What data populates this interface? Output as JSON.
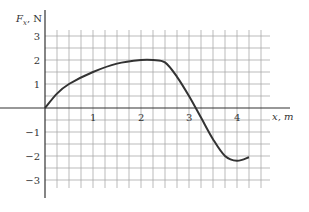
{
  "chart_data": {
    "type": "line",
    "title": "",
    "xlabel": "x, m",
    "ylabel": "F_x, N",
    "xlim": [
      0,
      4.5
    ],
    "ylim": [
      -3.5,
      3.5
    ],
    "grid": true,
    "x_ticks": [
      "1",
      "2",
      "3",
      "4"
    ],
    "y_ticks": [
      "3",
      "2",
      "1",
      "−1",
      "−2",
      "−3"
    ],
    "series": [
      {
        "name": "F_x(x)",
        "x": [
          0,
          0.25,
          0.5,
          1.0,
          1.5,
          2.0,
          2.25,
          2.5,
          2.75,
          3.0,
          3.25,
          3.5,
          3.75,
          4.0,
          4.25
        ],
        "y": [
          0,
          0.6,
          1.0,
          1.5,
          1.85,
          2.0,
          2.0,
          1.9,
          1.3,
          0.5,
          -0.4,
          -1.3,
          -2.0,
          -2.2,
          -2.05
        ]
      }
    ]
  },
  "axes": {
    "y_label_main": "F",
    "y_label_sub": "x",
    "y_label_unit": ", N",
    "x_label": "x, m"
  }
}
